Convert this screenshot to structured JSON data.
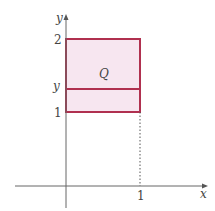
{
  "diagram": {
    "axes": {
      "x_label": "x",
      "y_label": "y"
    },
    "ticks": {
      "y_top": "2",
      "y_mid": "y",
      "y_bottom": "1",
      "x_right": "1"
    },
    "region_label": "Q",
    "colors": {
      "region_fill": "#f7e6f0",
      "region_stroke": "#b0304f",
      "axis": "#666666"
    }
  }
}
